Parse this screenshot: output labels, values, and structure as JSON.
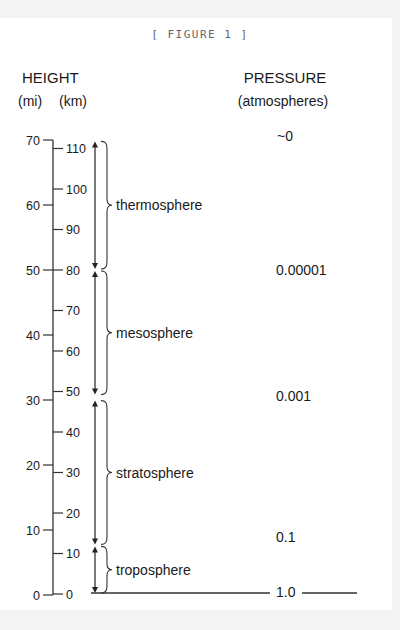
{
  "figure_label": "[ FIGURE 1 ]",
  "headers": {
    "height": "HEIGHT",
    "mi_unit": "(mi)",
    "km_unit": "(km)",
    "pressure": "PRESSURE",
    "pressure_unit": "(atmospheres)"
  },
  "mi_ticks": [
    0,
    10,
    20,
    30,
    40,
    50,
    60,
    70
  ],
  "km_ticks": [
    0,
    10,
    20,
    30,
    40,
    50,
    60,
    70,
    80,
    90,
    100,
    110
  ],
  "layers": [
    {
      "name": "troposphere",
      "bottom_km": 0,
      "top_km": 12
    },
    {
      "name": "stratosphere",
      "bottom_km": 12,
      "top_km": 48
    },
    {
      "name": "mesosphere",
      "bottom_km": 49,
      "top_km": 80
    },
    {
      "name": "thermosphere",
      "bottom_km": 80,
      "top_km": 112
    }
  ],
  "pressure_labels": [
    {
      "label": "1.0",
      "km": 0
    },
    {
      "label": "0.1",
      "km": 14
    },
    {
      "label": "0.001",
      "km": 49
    },
    {
      "label": "0.00001",
      "km": 80
    },
    {
      "label": "~0",
      "km": 113
    }
  ]
}
